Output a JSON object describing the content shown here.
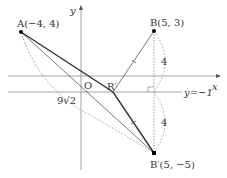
{
  "diagram": {
    "type": "coordinate-geometry",
    "axes": {
      "x_label": "x",
      "y_label": "y",
      "origin_label": "O"
    },
    "line_label": "y=−1",
    "points": {
      "A": {
        "label": "A(−4, 4)",
        "x": -4,
        "y": 4
      },
      "B": {
        "label": "B(5, 3)",
        "x": 5,
        "y": 3
      },
      "B_prime": {
        "label": "B′(5, −5)",
        "x": 5,
        "y": -5
      },
      "R_prime": {
        "label": "R′"
      }
    },
    "annotations": {
      "dist_upper": "4",
      "dist_lower": "4",
      "dist_AB": "9√2"
    },
    "colors": {
      "line": "#333333",
      "axis": "#999999",
      "dotted": "#888888"
    }
  }
}
